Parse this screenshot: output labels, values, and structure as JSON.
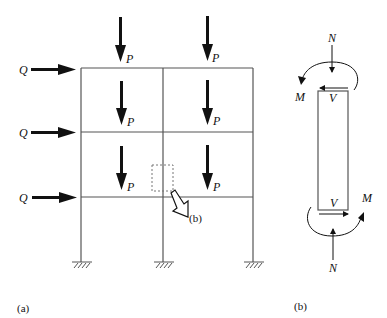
{
  "figure": {
    "panel_a": {
      "caption": "(a)",
      "load_vertical": "P",
      "load_horizontal": "Q",
      "detail_callout": "(b)",
      "stories": 3,
      "bays": 2
    },
    "panel_b": {
      "caption": "(b)",
      "axial_top": "N",
      "axial_bottom": "N",
      "moment_top": "M",
      "moment_bottom": "M",
      "shear_top": "V",
      "shear_bottom": "V"
    }
  },
  "colors": {
    "line": "#555555",
    "ink": "#111111"
  }
}
